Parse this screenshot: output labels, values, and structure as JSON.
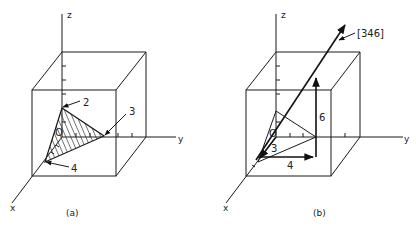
{
  "figure_a": {
    "caption": "(a)",
    "axes": {
      "x": "x",
      "y": "y",
      "z": "z"
    },
    "origin_label": "O",
    "intercept_labels": {
      "z": "2",
      "y": "3",
      "x": "4"
    },
    "shading": "hatched triangular plane"
  },
  "figure_b": {
    "caption": "(b)",
    "axes": {
      "x": "x",
      "y": "y",
      "z": "z"
    },
    "origin_label": "O",
    "direction_label": "[346]",
    "component_labels": {
      "x": "3",
      "y": "4",
      "z": "6"
    }
  },
  "colors": {
    "line": "#1a1a1a",
    "background": "#ffffff"
  }
}
